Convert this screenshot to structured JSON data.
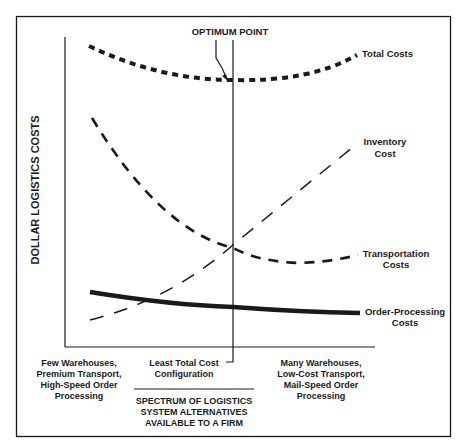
{
  "diagram": {
    "y_axis_label": "DOLLAR LOGISTICS COSTS",
    "optimum_label": "OPTIMUM POINT",
    "curves": [
      {
        "id": "total",
        "label": "Total Costs",
        "style": "heavy-dotted",
        "trend": "U-shaped, minimum at optimum point"
      },
      {
        "id": "inventory",
        "label_lines": [
          "Inventory",
          "Cost"
        ],
        "style": "thin-dashed",
        "trend": "increasing with number of warehouses"
      },
      {
        "id": "transportation",
        "label_lines": [
          "Transportation",
          "Costs"
        ],
        "style": "medium-dashed",
        "trend": "decreasing then flattening"
      },
      {
        "id": "order_processing",
        "label_lines": [
          "Order-Processing",
          "Costs"
        ],
        "style": "solid-thick",
        "trend": "slightly decreasing"
      }
    ],
    "x_labels": {
      "left": [
        "Few Warehouses,",
        "Premium Transport,",
        "High-Speed Order",
        "Processing"
      ],
      "center": [
        "Least Total Cost",
        "Configuration"
      ],
      "right": [
        "Many Warehouses,",
        "Low-Cost Transport,",
        "Mail-Speed Order",
        "Processing"
      ]
    },
    "x_axis_title": [
      "SPECTRUM OF LOGISTICS",
      "SYSTEM ALTERNATIVES",
      "AVAILABLE TO A FIRM"
    ]
  }
}
